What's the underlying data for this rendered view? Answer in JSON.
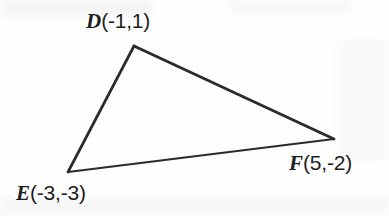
{
  "figure": {
    "kind": "geometry-diagram",
    "shape_name": "triangle",
    "background_color": "#fefefe",
    "stroke_color": "#2b2b2b"
  },
  "vertices": [
    {
      "id": "D",
      "letter": "D",
      "coords_text": "(-1,1)",
      "label_text": "D(-1,1)",
      "math_x": -1,
      "math_y": 1,
      "px": 134,
      "py": 46,
      "label_position": "above"
    },
    {
      "id": "E",
      "letter": "E",
      "coords_text": "(-3,-3)",
      "label_text": "E(-3,-3)",
      "math_x": -3,
      "math_y": -3,
      "px": 68,
      "py": 172,
      "label_position": "below-left"
    },
    {
      "id": "F",
      "letter": "F",
      "coords_text": "(5,-2)",
      "label_text": "F(5,-2)",
      "math_x": 5,
      "math_y": -2,
      "px": 334,
      "py": 139,
      "label_position": "below-right"
    }
  ],
  "edges": [
    {
      "id": "DF",
      "from": "D",
      "to": "F",
      "stroke_width": 2.9
    },
    {
      "id": "DE",
      "from": "D",
      "to": "E",
      "stroke_width": 2.7
    },
    {
      "id": "EF",
      "from": "E",
      "to": "F",
      "stroke_width": 2.2
    }
  ]
}
